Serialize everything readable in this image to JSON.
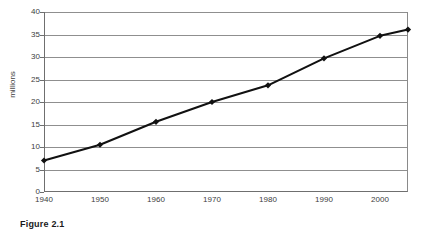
{
  "figure": {
    "caption": "Figure 2.1"
  },
  "chart_data": {
    "type": "line",
    "title": "",
    "subtitle": "",
    "xlabel": "",
    "ylabel": "millions",
    "xlim": [
      1940,
      2005
    ],
    "ylim": [
      0,
      40
    ],
    "grid": true,
    "legend": false,
    "legend_position": "none",
    "x_ticks": [
      1940,
      1950,
      1960,
      1970,
      1980,
      1990,
      2000
    ],
    "x_tick_labels": [
      "1940",
      "1950",
      "1960",
      "1970",
      "1980",
      "1990",
      "2000"
    ],
    "y_ticks": [
      0,
      5,
      10,
      15,
      20,
      25,
      30,
      35,
      40
    ],
    "y_tick_labels": [
      "0",
      "5",
      "10",
      "15",
      "20",
      "25",
      "30",
      "35",
      "40"
    ],
    "series": [
      {
        "name": "population",
        "marker": "diamond",
        "color": "#111111",
        "x": [
          1940,
          1950,
          1960,
          1970,
          1980,
          1990,
          2000,
          2005
        ],
        "values": [
          7.0,
          10.5,
          15.6,
          20.0,
          23.7,
          29.7,
          34.7,
          36.1
        ]
      }
    ],
    "colors": {
      "line": "#111111",
      "marker": "#111111",
      "grid": "#8f8f8f",
      "axis": "#6f6f6f",
      "text": "#3d3d3d",
      "background": "#ffffff"
    }
  }
}
